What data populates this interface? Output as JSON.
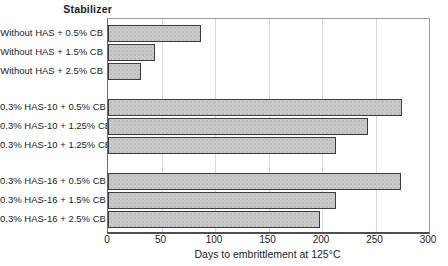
{
  "chart_data": {
    "type": "bar",
    "orientation": "horizontal",
    "title": "Stabilizer",
    "xlabel": "Days to embrittlement at 125°C",
    "xlim": [
      0,
      300
    ],
    "xticks": [
      0,
      50,
      100,
      150,
      200,
      250,
      300
    ],
    "grid": "vertical",
    "group_size": 3,
    "categories": [
      "Without HAS + 0.5% CB",
      "Without HAS + 1.5% CB",
      "Without HAS + 2.5% CB",
      "0.3% HAS-10 + 0.5% CB",
      "0.3% HAS-10 + 1.25% CB",
      "0.3% HAS-10 + 1.25% CB",
      "0.3% HAS-16 + 0.5% CB",
      "0.3% HAS-16 + 1.5% CB",
      "0.3% HAS-16 + 2.5% CB"
    ],
    "values": [
      85,
      42,
      29,
      273,
      241,
      211,
      272,
      211,
      196
    ],
    "colors": {
      "bar_fill": "#cbcbcb",
      "bar_border": "#3c3c3c",
      "gridline": "#d9d9d9",
      "axis": "#4f4f4f",
      "text": "#1d1d1d"
    }
  }
}
